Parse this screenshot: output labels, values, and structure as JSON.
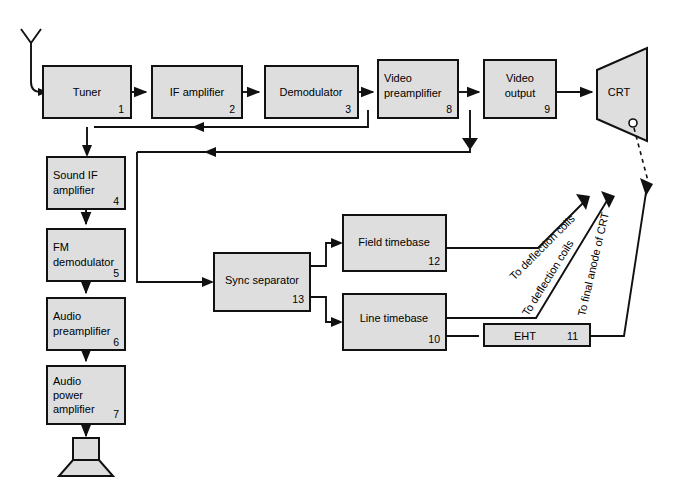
{
  "diagram": {
    "colors": {
      "block_fill": "#dedede",
      "stroke": "#111111",
      "background": "#ffffff"
    },
    "blocks": [
      {
        "id": "tuner",
        "label_lines": [
          "Tuner"
        ],
        "number": "1",
        "x": 43,
        "y": 66,
        "w": 88,
        "h": 52
      },
      {
        "id": "if-amplifier",
        "label_lines": [
          "IF amplifier"
        ],
        "number": "2",
        "x": 152,
        "y": 66,
        "w": 90,
        "h": 52
      },
      {
        "id": "demodulator",
        "label_lines": [
          "Demodulator"
        ],
        "number": "3",
        "x": 265,
        "y": 66,
        "w": 93,
        "h": 52
      },
      {
        "id": "video-preamp",
        "label_lines": [
          "Video",
          "preamplifier"
        ],
        "number": "8",
        "x": 378,
        "y": 60,
        "w": 80,
        "h": 58
      },
      {
        "id": "video-output",
        "label_lines": [
          "Video",
          "output"
        ],
        "number": "9",
        "x": 484,
        "y": 60,
        "w": 72,
        "h": 58
      },
      {
        "id": "sound-if",
        "label_lines": [
          "Sound IF",
          "amplifier"
        ],
        "number": "4",
        "x": 47,
        "y": 157,
        "w": 78,
        "h": 52
      },
      {
        "id": "fm-demodulator",
        "label_lines": [
          "FM",
          "demodulator"
        ],
        "number": "5",
        "x": 47,
        "y": 229,
        "w": 78,
        "h": 52
      },
      {
        "id": "audio-preamp",
        "label_lines": [
          "Audio",
          "preamplifier"
        ],
        "number": "6",
        "x": 47,
        "y": 298,
        "w": 78,
        "h": 52
      },
      {
        "id": "audio-power",
        "label_lines": [
          "Audio",
          "power",
          "amplifier"
        ],
        "number": "7",
        "x": 47,
        "y": 366,
        "w": 78,
        "h": 58
      },
      {
        "id": "sync-separator",
        "label_lines": [
          "Sync separator"
        ],
        "number": "13",
        "x": 214,
        "y": 253,
        "w": 96,
        "h": 58
      },
      {
        "id": "field-timebase",
        "label_lines": [
          "Field timebase"
        ],
        "number": "12",
        "x": 343,
        "y": 215,
        "w": 103,
        "h": 56
      },
      {
        "id": "line-timebase",
        "label_lines": [
          "Line timebase"
        ],
        "number": "10",
        "x": 343,
        "y": 294,
        "w": 103,
        "h": 56
      },
      {
        "id": "eht",
        "label_lines": [
          "EHT"
        ],
        "number": "11",
        "x": 484,
        "y": 324,
        "w": 106,
        "h": 22
      }
    ],
    "crt": {
      "id": "crt",
      "label": "CRT"
    },
    "antenna": {
      "id": "antenna-icon",
      "label": ""
    },
    "speaker": {
      "id": "speaker-icon",
      "label": ""
    },
    "diagonal_labels": [
      {
        "id": "to-deflection-coils-field",
        "text": "To deflection coils"
      },
      {
        "id": "to-deflection-coils-line",
        "text": "To deflection coils"
      },
      {
        "id": "to-final-anode-of-crt",
        "text": "To final anode of CRT"
      }
    ]
  }
}
